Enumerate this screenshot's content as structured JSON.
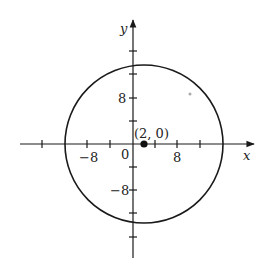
{
  "diagram": {
    "type": "circle-on-coordinate-plane",
    "axes": {
      "x_label": "x",
      "y_label": "y",
      "origin_label": "0",
      "tick_step": 4,
      "x_tick_labels": [
        {
          "value": -8,
          "label": "−8"
        },
        {
          "value": 8,
          "label": "8"
        }
      ],
      "y_tick_labels": [
        {
          "value": 8,
          "label": "8"
        },
        {
          "value": -8,
          "label": "−8"
        }
      ]
    },
    "circle": {
      "center": [
        2,
        0
      ],
      "center_label": "(2, 0)",
      "radius": 14
    },
    "colors": {
      "stroke": "#1a1a1a",
      "stray_dot": "#aaaaaa"
    }
  }
}
